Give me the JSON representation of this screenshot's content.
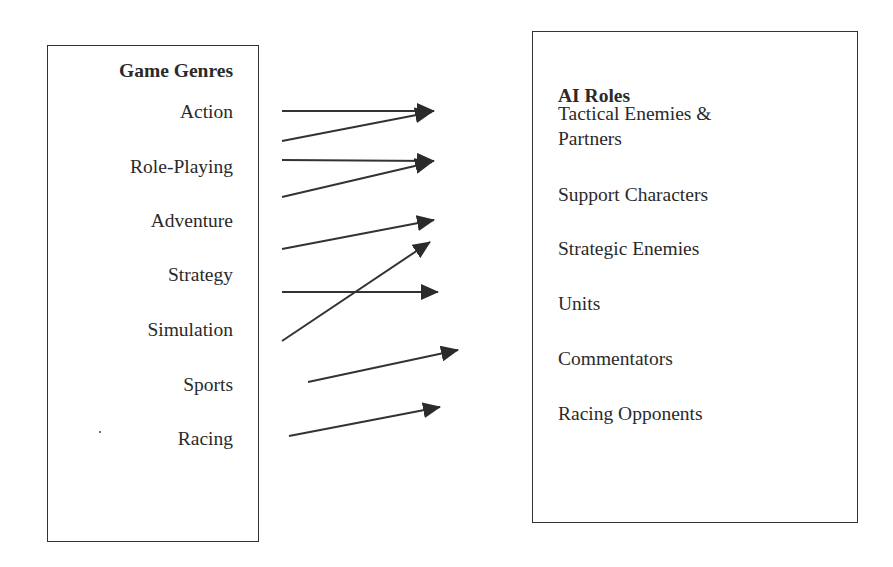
{
  "left_panel": {
    "title": "Game Genres",
    "items": [
      {
        "label": "Action"
      },
      {
        "label": "Role-Playing"
      },
      {
        "label": "Adventure"
      },
      {
        "label": "Strategy"
      },
      {
        "label": "Simulation"
      },
      {
        "label": "Sports"
      },
      {
        "label": "Racing"
      }
    ]
  },
  "right_panel": {
    "title": "AI Roles",
    "items": [
      {
        "label": "Tactical Enemies &",
        "label_line2": "Partners"
      },
      {
        "label": "Support Characters"
      },
      {
        "label": "Strategic Enemies"
      },
      {
        "label": "Units"
      },
      {
        "label": "Commentators"
      },
      {
        "label": "Racing Opponents"
      }
    ]
  },
  "mappings": [
    {
      "from": "Action",
      "to": "Tactical Enemies & Partners"
    },
    {
      "from": "Role-Playing",
      "to": "Tactical Enemies & Partners"
    },
    {
      "from": "Role-Playing",
      "to": "Support Characters"
    },
    {
      "from": "Adventure",
      "to": "Support Characters"
    },
    {
      "from": "Adventure",
      "to": "Strategic Enemies"
    },
    {
      "from": "Simulation",
      "to": "Strategic Enemies"
    },
    {
      "from": "Strategy",
      "to": "Units"
    },
    {
      "from": "Sports",
      "to": "Commentators"
    },
    {
      "from": "Racing",
      "to": "Racing Opponents"
    }
  ],
  "colors": {
    "line": "#333333",
    "text": "#2a2a2a",
    "background": "#ffffff"
  }
}
